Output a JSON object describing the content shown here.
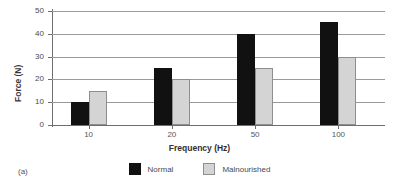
{
  "panel": {
    "label": "(a)"
  },
  "chart_data": {
    "type": "bar",
    "title": "",
    "xlabel": "Frequency (Hz)",
    "ylabel": "Force (N)",
    "categories": [
      "10",
      "20",
      "50",
      "100"
    ],
    "series": [
      {
        "name": "Normal",
        "color": "#111111",
        "values": [
          10,
          25,
          40,
          45
        ]
      },
      {
        "name": "Malnourished",
        "color": "#d4d4d4",
        "values": [
          15,
          20,
          25,
          30
        ]
      }
    ],
    "ylim": [
      0,
      50
    ],
    "yticks": [
      "0",
      "10",
      "20",
      "30",
      "40",
      "50"
    ],
    "ytick_values": [
      0,
      10,
      20,
      30,
      40,
      50
    ],
    "grid": "horizontal",
    "legend_position": "bottom-center"
  },
  "colors": {
    "normal": "#111111",
    "malnourished": "#d4d4d4",
    "malnourished_border": "#8e8e8e",
    "gridline": "#9a9a9a",
    "axis": "#6e6e6e",
    "text": "#4a4a4a",
    "background": "#ffffff"
  }
}
